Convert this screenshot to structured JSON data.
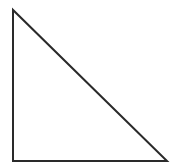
{
  "canvas": {
    "width": 189,
    "height": 167,
    "background_color": "#ffffff"
  },
  "figure": {
    "name": "right-triangle",
    "fill": "none",
    "stroke_color": "#2a2a2a",
    "stroke_width": 2,
    "closed": true,
    "points": "13,10 13,161 167,161",
    "vertices": [
      {
        "label": "apex-top-left",
        "x": 13,
        "y": 10
      },
      {
        "label": "right-angle-bottom-left",
        "x": 13,
        "y": 161
      },
      {
        "label": "vertex-bottom-right",
        "x": 167,
        "y": 161
      }
    ],
    "edges": [
      {
        "label": "vertical-leg",
        "from": "apex-top-left",
        "to": "right-angle-bottom-left",
        "length": 151
      },
      {
        "label": "horizontal-leg",
        "from": "right-angle-bottom-left",
        "to": "vertex-bottom-right",
        "length": 154
      },
      {
        "label": "hypotenuse",
        "from": "vertex-bottom-right",
        "to": "apex-top-left",
        "length": 216
      }
    ],
    "right_angle_at": "right-angle-bottom-left"
  }
}
